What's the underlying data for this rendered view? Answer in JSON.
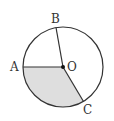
{
  "diagram": {
    "type": "circle-sector",
    "labels": {
      "A": "A",
      "B": "B",
      "C": "C",
      "O": "O"
    },
    "colors": {
      "stroke": "#333333",
      "fill_sector": "#dedede",
      "background": "#ffffff"
    },
    "shaded_region": "sector AOC"
  }
}
